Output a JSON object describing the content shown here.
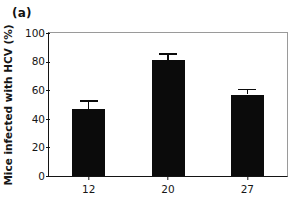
{
  "panel": {
    "label": "(a)"
  },
  "chart_data": {
    "type": "bar",
    "title": "",
    "subtitle": "",
    "xlabel": "",
    "ylabel": "Mice infected with HCV (%)",
    "categories": [
      "12",
      "20",
      "27"
    ],
    "values": [
      47,
      81,
      57
    ],
    "errors": [
      6,
      5,
      4
    ],
    "error_direction": "upper-only",
    "ylim": [
      0,
      100
    ],
    "yticks": [
      0,
      20,
      40,
      60,
      80,
      100
    ],
    "ytick_labels": [
      "0",
      "20",
      "40",
      "60",
      "80",
      "100"
    ],
    "xtick_labels": [
      "12",
      "20",
      "27"
    ],
    "grid": false,
    "legend": null,
    "bar_color": "#0b0b0b",
    "axis_color": "#141414",
    "frame_color": "#9a9a9a",
    "background": "#ffffff"
  }
}
